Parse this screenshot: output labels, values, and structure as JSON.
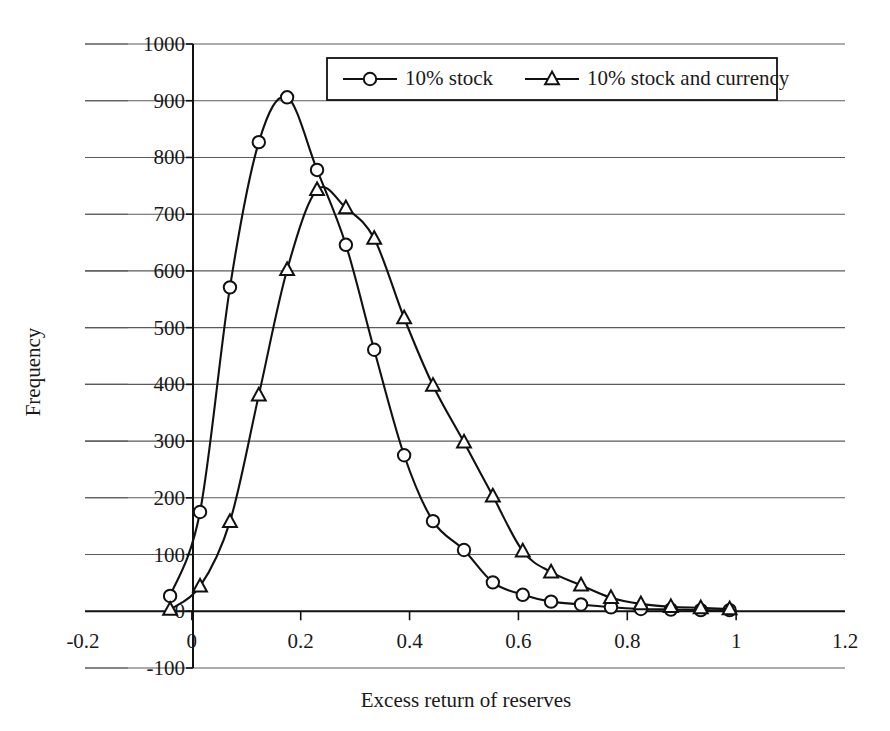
{
  "chart_data": {
    "type": "line",
    "title": "",
    "xlabel": "Excess return of reserves",
    "ylabel": "Frequency",
    "xlim": [
      -0.2,
      1.2
    ],
    "ylim": [
      -100,
      1000
    ],
    "grid": true,
    "legend_position": "top-center",
    "x_ticks": [
      "-0.2",
      "0",
      "0.2",
      "0.4",
      "0.6",
      "0.8",
      "1",
      "1.2"
    ],
    "x_tick_values": [
      -0.2,
      0,
      0.2,
      0.4,
      0.6,
      0.8,
      1.0,
      1.2
    ],
    "y_ticks": [
      "-100",
      "0",
      "100",
      "200",
      "300",
      "400",
      "500",
      "600",
      "700",
      "800",
      "900",
      "1000"
    ],
    "y_tick_values": [
      -100,
      0,
      100,
      200,
      300,
      400,
      500,
      600,
      700,
      800,
      900,
      1000
    ],
    "x": [
      -0.04,
      0.015,
      0.07,
      0.123,
      0.175,
      0.23,
      0.283,
      0.335,
      0.39,
      0.443,
      0.5,
      0.553,
      0.608,
      0.66,
      0.715,
      0.77,
      0.825,
      0.88,
      0.935,
      0.988
    ],
    "series": [
      {
        "name": "10% stock",
        "marker": "circle",
        "values": [
          27,
          175,
          571,
          827,
          906,
          778,
          646,
          461,
          275,
          159,
          108,
          51,
          29,
          17,
          12,
          7,
          4,
          3,
          2,
          2
        ]
      },
      {
        "name": "10% stock and currency",
        "marker": "triangle",
        "values": [
          3,
          44,
          158,
          381,
          602,
          743,
          711,
          657,
          517,
          398,
          298,
          203,
          106,
          69,
          46,
          24,
          13,
          8,
          6,
          4
        ]
      }
    ],
    "colors": {
      "series_stroke": "#111111",
      "marker_fill": "#ffffff",
      "gridline": "#5a5a5a",
      "axis": "#111111",
      "background": "#ffffff"
    }
  },
  "legend": {
    "items": [
      {
        "label": "10% stock",
        "marker": "circle-marker"
      },
      {
        "label": "10% stock and currency",
        "marker": "triangle-marker"
      }
    ]
  },
  "axes": {
    "x_title": "Excess return of reserves",
    "y_title": "Frequency"
  }
}
